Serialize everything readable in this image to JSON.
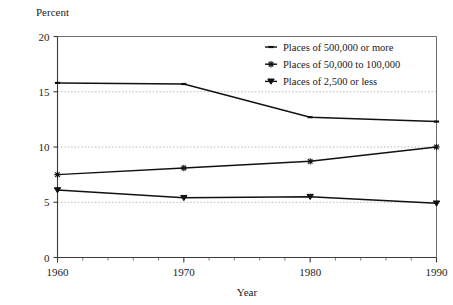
{
  "chart_data": {
    "type": "line",
    "title": "",
    "xlabel": "Year",
    "ylabel": "Percent",
    "x": [
      1960,
      1970,
      1980,
      1990
    ],
    "xtick_labels": [
      "1960",
      "1970",
      "1980",
      "1990"
    ],
    "ytick_labels": [
      "0",
      "5",
      "10",
      "15",
      "20"
    ],
    "yticks": [
      0,
      5,
      10,
      15,
      20
    ],
    "xlim": [
      1960,
      1990
    ],
    "ylim": [
      0,
      20
    ],
    "grid": "horizontal-dotted-at-5-10-15",
    "legend_position": "top-right-inside",
    "series": [
      {
        "name": "Places of 500,000 or more",
        "marker": "dash",
        "values": [
          15.8,
          15.7,
          12.7,
          12.3
        ]
      },
      {
        "name": "Places of 50,000 to 100,000",
        "marker": "star",
        "values": [
          7.5,
          8.1,
          8.7,
          10.0
        ]
      },
      {
        "name": "Places of 2,500 or less",
        "marker": "triangle-down",
        "values": [
          6.1,
          5.4,
          5.5,
          4.9
        ]
      }
    ],
    "colors": {
      "line": "#111111",
      "grid": "#b4b4b4",
      "axis": "#3b3b3b",
      "frame": "#6e6e6e",
      "background": "#ffffff",
      "text": "#1a1a1a"
    }
  }
}
